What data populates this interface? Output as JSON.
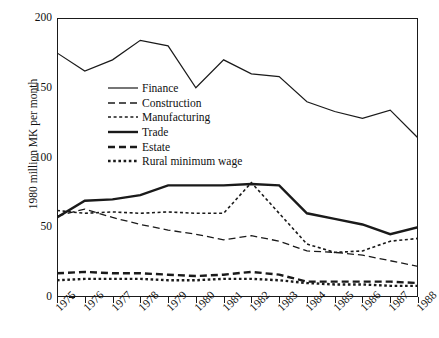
{
  "chart_data": {
    "type": "line",
    "title": "",
    "xlabel": "",
    "ylabel": "1980 million MK per month",
    "xlim": [
      1975,
      1988
    ],
    "ylim": [
      0,
      200
    ],
    "yticks": [
      0,
      50,
      100,
      150,
      200
    ],
    "grid": false,
    "legend_position": "inside-upper-left",
    "x": [
      1975,
      1976,
      1977,
      1978,
      1979,
      1980,
      1981,
      1982,
      1983,
      1984,
      1985,
      1986,
      1987,
      1988
    ],
    "categories": [
      "1975",
      "1976",
      "1977",
      "1978",
      "1979",
      "1980",
      "1981",
      "1982",
      "1983",
      "1984",
      "1985",
      "1986",
      "1987",
      "1988"
    ],
    "series": [
      {
        "name": "Finance",
        "style": "solid-thin",
        "values": [
          175,
          162,
          170,
          184,
          180,
          150,
          170,
          160,
          158,
          140,
          133,
          128,
          134,
          114
        ]
      },
      {
        "name": "Construction",
        "style": "dashed",
        "values": [
          58,
          63,
          57,
          52,
          48,
          45,
          41,
          44,
          40,
          33,
          32,
          30,
          26,
          22
        ]
      },
      {
        "name": "Manufacturing",
        "style": "dotted",
        "values": [
          62,
          60,
          61,
          60,
          61,
          60,
          60,
          82,
          60,
          38,
          32,
          33,
          40,
          42
        ]
      },
      {
        "name": "Trade",
        "style": "solid-thick",
        "values": [
          57,
          69,
          70,
          73,
          80,
          80,
          80,
          81,
          80,
          60,
          56,
          52,
          45,
          50
        ]
      },
      {
        "name": "Estate",
        "style": "dashed-thick",
        "values": [
          17,
          18,
          17,
          17,
          16,
          15,
          16,
          18,
          16,
          11,
          11,
          11,
          11,
          10
        ]
      },
      {
        "name": "Rural minimum wage",
        "style": "dotted-thick",
        "values": [
          12,
          13,
          13,
          13,
          12,
          12,
          13,
          13,
          12,
          10,
          9,
          9,
          8,
          8
        ]
      }
    ]
  }
}
